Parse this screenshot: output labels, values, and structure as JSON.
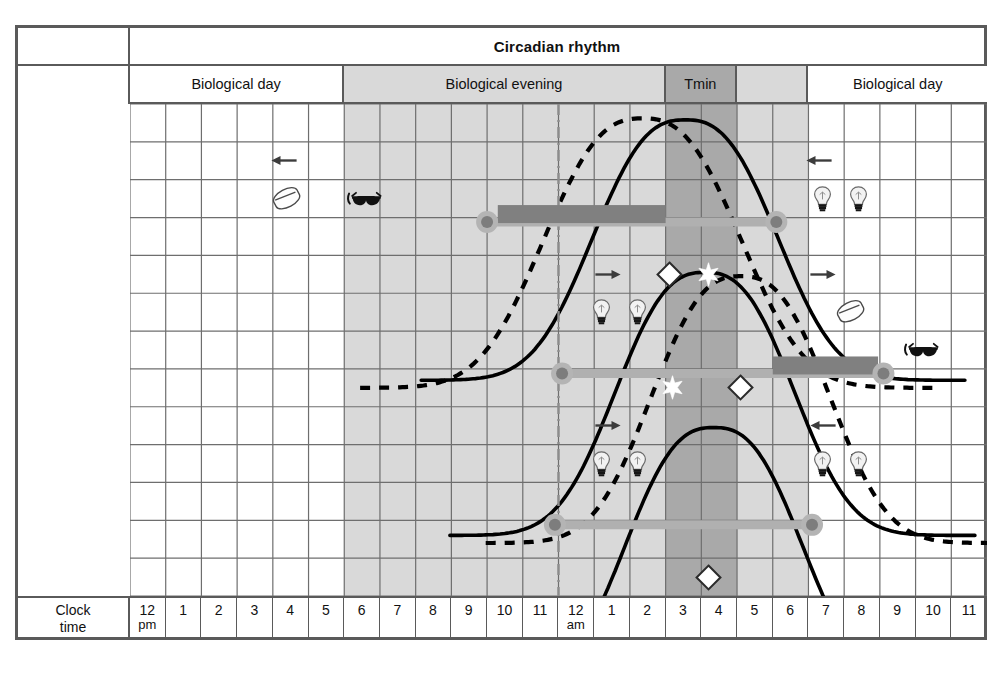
{
  "figure": {
    "title": "Circadian rhythm",
    "axis_row_label_line1": "Clock",
    "axis_row_label_line2": "time"
  },
  "colors": {
    "frame": "#5a5a5a",
    "grid": "#6e6e6e",
    "shade_light": "#d9d9d9",
    "shade_dark": "#a9a9a9",
    "bar_dark": "#808080",
    "bar_light": "#b0b0b0",
    "curve": "#000000",
    "background": "#ffffff"
  },
  "phase_header": [
    {
      "label": "Biological day",
      "start_hour": 0,
      "end_hour": 6,
      "shade": "none"
    },
    {
      "label": "Biological evening",
      "start_hour": 6,
      "end_hour": 15,
      "shade": "light"
    },
    {
      "label": "Tmin",
      "start_hour": 15,
      "end_hour": 17,
      "shade": "dark"
    },
    {
      "label": "",
      "start_hour": 17,
      "end_hour": 19,
      "shade": "light"
    },
    {
      "label": "Biological day",
      "start_hour": 19,
      "end_hour": 24,
      "shade": "none"
    }
  ],
  "clock_times": [
    {
      "hour": "12",
      "meridiem": "pm"
    },
    {
      "hour": "1",
      "meridiem": ""
    },
    {
      "hour": "2",
      "meridiem": ""
    },
    {
      "hour": "3",
      "meridiem": ""
    },
    {
      "hour": "4",
      "meridiem": ""
    },
    {
      "hour": "5",
      "meridiem": ""
    },
    {
      "hour": "6",
      "meridiem": ""
    },
    {
      "hour": "7",
      "meridiem": ""
    },
    {
      "hour": "8",
      "meridiem": ""
    },
    {
      "hour": "9",
      "meridiem": ""
    },
    {
      "hour": "10",
      "meridiem": ""
    },
    {
      "hour": "11",
      "meridiem": ""
    },
    {
      "hour": "12",
      "meridiem": "am"
    },
    {
      "hour": "1",
      "meridiem": ""
    },
    {
      "hour": "2",
      "meridiem": ""
    },
    {
      "hour": "3",
      "meridiem": ""
    },
    {
      "hour": "4",
      "meridiem": ""
    },
    {
      "hour": "5",
      "meridiem": ""
    },
    {
      "hour": "6",
      "meridiem": ""
    },
    {
      "hour": "7",
      "meridiem": ""
    },
    {
      "hour": "8",
      "meridiem": ""
    },
    {
      "hour": "9",
      "meridiem": ""
    },
    {
      "hour": "10",
      "meridiem": ""
    },
    {
      "hour": "11",
      "meridiem": ""
    }
  ],
  "chart_data": {
    "type": "line",
    "title": "Circadian rhythm",
    "xlabel": "Clock time",
    "ylabel": "",
    "xlim": [
      0,
      24
    ],
    "x_tick_labels": [
      "12 pm",
      "1",
      "2",
      "3",
      "4",
      "5",
      "6",
      "7",
      "8",
      "9",
      "10",
      "11",
      "12 am",
      "1",
      "2",
      "3",
      "4",
      "5",
      "6",
      "7",
      "8",
      "9",
      "10",
      "11"
    ],
    "grid": true,
    "legend": "none",
    "midnight_marker_hour": 12,
    "tmin_hours": [
      15,
      17
    ],
    "series": [
      {
        "name": "night 1 solid",
        "style": "solid",
        "peak_hour": 15.6,
        "rise_hour": 11.9,
        "row": "top"
      },
      {
        "name": "night 1 dashed",
        "style": "dashed",
        "peak_hour": 14.4,
        "rise_hour": 10.4,
        "row": "top"
      },
      {
        "name": "night 2 solid",
        "style": "solid",
        "peak_hour": 16.2,
        "rise_hour": 12.6,
        "row": "mid"
      },
      {
        "name": "night 2 dashed",
        "style": "dashed",
        "peak_hour": 17.1,
        "rise_hour": 13.5,
        "row": "mid"
      },
      {
        "name": "night 3 solid",
        "style": "solid",
        "peak_hour": 16.4,
        "rise_hour": 12.9,
        "row": "bottom"
      }
    ]
  },
  "markers": [
    {
      "id": "arrow-left-day1",
      "icon": "arrow-left-icon",
      "hour": 4.3,
      "row": 1
    },
    {
      "id": "pill-day1",
      "icon": "pill-icon",
      "hour": 4.4,
      "row": 2
    },
    {
      "id": "sunglasses-evening1",
      "icon": "sunglasses-icon",
      "hour": 6.6,
      "row": 2
    },
    {
      "id": "arrow-left-morning1",
      "icon": "arrow-left-icon",
      "hour": 19.3,
      "row": 1
    },
    {
      "id": "bulb-morning1-a",
      "icon": "light-bulb-icon",
      "hour": 19.4,
      "row": 2
    },
    {
      "id": "bulb-morning1-b",
      "icon": "light-bulb-icon",
      "hour": 20.4,
      "row": 2
    },
    {
      "id": "diamond-open-1",
      "icon": "diamond-open-icon",
      "hour": 15.1,
      "row": 4
    },
    {
      "id": "diamond-filled-1",
      "icon": "diamond-star-icon",
      "hour": 16.2,
      "row": 4
    },
    {
      "id": "arrow-right-night2",
      "icon": "arrow-right-icon",
      "hour": 13.4,
      "row": 4
    },
    {
      "id": "arrow-right-morning2",
      "icon": "arrow-right-icon",
      "hour": 19.4,
      "row": 4
    },
    {
      "id": "bulb-night2-a",
      "icon": "light-bulb-icon",
      "hour": 13.2,
      "row": 5
    },
    {
      "id": "bulb-night2-b",
      "icon": "light-bulb-icon",
      "hour": 14.2,
      "row": 5
    },
    {
      "id": "pill-morning2",
      "icon": "pill-icon",
      "hour": 20.2,
      "row": 5
    },
    {
      "id": "sunglasses-morning2",
      "icon": "sunglasses-icon",
      "hour": 22.2,
      "row": 6
    },
    {
      "id": "diamond-star-2",
      "icon": "diamond-star-icon",
      "hour": 15.2,
      "row": 7
    },
    {
      "id": "diamond-open-2",
      "icon": "diamond-open-icon",
      "hour": 17.1,
      "row": 7
    },
    {
      "id": "arrow-right-night3",
      "icon": "arrow-right-icon",
      "hour": 13.4,
      "row": 8
    },
    {
      "id": "arrow-left-morning3",
      "icon": "arrow-left-icon",
      "hour": 19.4,
      "row": 8
    },
    {
      "id": "bulb-night3-a",
      "icon": "light-bulb-icon",
      "hour": 13.2,
      "row": 9
    },
    {
      "id": "bulb-night3-b",
      "icon": "light-bulb-icon",
      "hour": 14.2,
      "row": 9
    },
    {
      "id": "bulb-morning3-a",
      "icon": "light-bulb-icon",
      "hour": 19.4,
      "row": 9
    },
    {
      "id": "bulb-morning3-b",
      "icon": "light-bulb-icon",
      "hour": 20.4,
      "row": 9
    },
    {
      "id": "diamond-open-3",
      "icon": "diamond-open-icon",
      "hour": 16.2,
      "row": 12
    }
  ],
  "sleep_bars": [
    {
      "id": "sleep-bar-night1",
      "start_hour": 10.0,
      "end_hour": 18.1,
      "dark_end_hour": 15.0,
      "row": 3
    },
    {
      "id": "sleep-bar-night2",
      "start_hour": 12.1,
      "end_hour": 21.1,
      "dark_start_hour": 18.0,
      "row": 7
    },
    {
      "id": "sleep-bar-night3",
      "start_hour": 11.9,
      "end_hour": 19.1,
      "row": 11
    }
  ]
}
